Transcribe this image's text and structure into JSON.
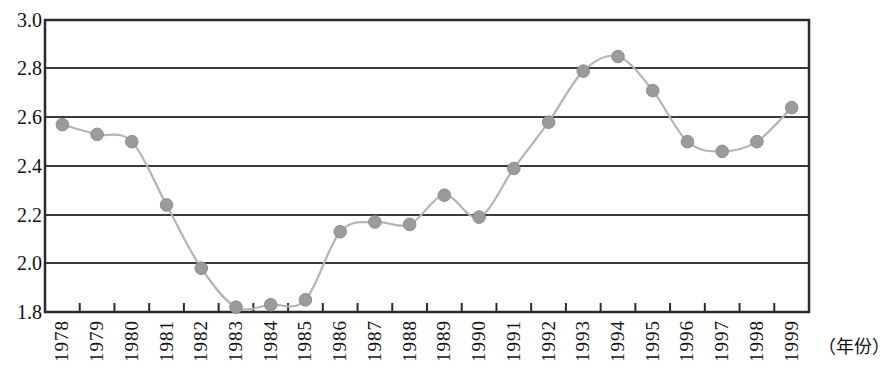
{
  "chart_data": {
    "type": "line",
    "title": "",
    "subtitle": "",
    "xlabel": "（年份）",
    "ylabel": "",
    "categories": [
      "1978",
      "1979",
      "1980",
      "1981",
      "1982",
      "1983",
      "1984",
      "1985",
      "1986",
      "1987",
      "1988",
      "1989",
      "1990",
      "1991",
      "1992",
      "1993",
      "1994",
      "1995",
      "1996",
      "1997",
      "1998",
      "1999"
    ],
    "values": [
      2.57,
      2.53,
      2.5,
      2.24,
      1.98,
      1.82,
      1.83,
      1.85,
      2.13,
      2.17,
      2.16,
      2.28,
      2.19,
      2.39,
      2.58,
      2.79,
      2.85,
      2.71,
      2.5,
      2.46,
      2.5,
      2.64
    ],
    "series": [
      {
        "name": "",
        "values": [
          2.57,
          2.53,
          2.5,
          2.24,
          1.98,
          1.82,
          1.83,
          1.85,
          2.13,
          2.17,
          2.16,
          2.28,
          2.19,
          2.39,
          2.58,
          2.79,
          2.85,
          2.71,
          2.5,
          2.46,
          2.5,
          2.64
        ]
      }
    ],
    "ylim": [
      1.8,
      3.0
    ],
    "ytick_labels": [
      "3.0",
      "2.8",
      "2.6",
      "2.4",
      "2.2",
      "2.0",
      "1.8"
    ],
    "ytick_values": [
      3.0,
      2.8,
      2.6,
      2.4,
      2.2,
      2.0,
      1.8
    ],
    "grid": true,
    "grid_axis": "y",
    "legend": "none",
    "marker": "circle",
    "marker_color": "#9b9b9b",
    "line_color": "#b4b4b4",
    "grid_color": "#3a3a3a",
    "axis_color": "#2b2b2b",
    "smoothing": "spline"
  },
  "axis_caption": "（年份）"
}
